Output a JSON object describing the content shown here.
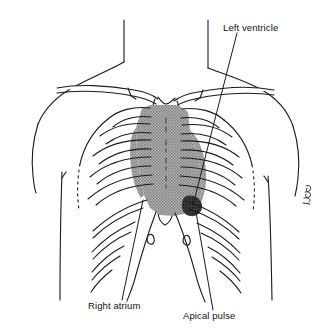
{
  "figure": {
    "type": "anatomical-line-drawing",
    "background_color": "#ffffff",
    "ink_color": "#1a1a1a",
    "heart_fill_color": "#9a9a9a",
    "apex_fill_color": "#2b2b2b",
    "bone_fill_color": "#ffffff"
  },
  "annotations": {
    "left_ventricle": {
      "label": "Left ventricle",
      "leader_from": [
        237,
        33
      ],
      "leader_to": [
        193,
        205
      ]
    },
    "right_atrium": {
      "label": "Right atrium",
      "leader_from": [
        122,
        300
      ],
      "leader_to": [
        143,
        200
      ]
    },
    "apical_pulse": {
      "label": "Apical pulse",
      "leader_from": [
        213,
        310
      ],
      "leader_to": [
        196,
        212
      ]
    }
  },
  "structures": {
    "neck_left": "neck-outline-left",
    "neck_right": "neck-outline-right",
    "shoulder_left": "shoulder-outline-left",
    "shoulder_right": "shoulder-outline-right",
    "arm_left": "arm-outline-left",
    "arm_right": "arm-outline-right",
    "clavicle_left": "clavicle-left",
    "clavicle_right": "clavicle-right",
    "sternum": "sternum",
    "xiphoid": "xiphoid-process",
    "ribs_left": "rib-cage-left",
    "ribs_right": "rib-cage-right",
    "heart": "heart-silhouette",
    "apex": "cardiac-apex",
    "signature": "artist-signature"
  }
}
